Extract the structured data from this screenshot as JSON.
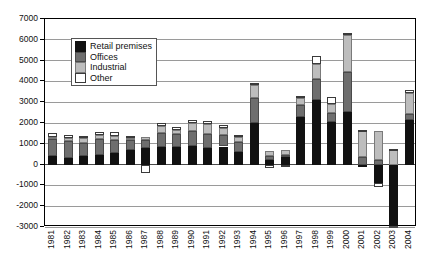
{
  "chart_data": {
    "type": "bar",
    "stacked": true,
    "title": "",
    "subtitle": "",
    "xlabel": "",
    "ylabel": "",
    "ylim": [
      -3000,
      7000
    ],
    "ytick_step": 1000,
    "yticks": [
      7000,
      6000,
      5000,
      4000,
      3000,
      2000,
      1000,
      0,
      -1000,
      -2000,
      -3000
    ],
    "ytick_labels": [
      "7000",
      "6000",
      "5000",
      "4000",
      "3000",
      "2000",
      "1000",
      "0",
      "-1000",
      "-2000",
      "-3000"
    ],
    "grid": true,
    "legend_position": "upper-left-inside",
    "categories": [
      "1981",
      "1982",
      "1983",
      "1984",
      "1985",
      "1986",
      "1987",
      "1988",
      "1989",
      "1990",
      "1991",
      "1992",
      "1993",
      "1994",
      "1995",
      "1996",
      "1997",
      "1998",
      "1999",
      "2000",
      "2001",
      "2002",
      "2003",
      "2004"
    ],
    "series": [
      {
        "name": "Retail premises",
        "color": "#111111",
        "values": [
          400,
          330,
          420,
          460,
          540,
          700,
          790,
          850,
          860,
          900,
          800,
          870,
          600,
          2000,
          200,
          380,
          2300,
          3100,
          2050,
          2550,
          -100,
          -900,
          -2950,
          2150
        ]
      },
      {
        "name": "Offices",
        "color": "#6e6e6e",
        "values": [
          820,
          790,
          640,
          790,
          660,
          480,
          390,
          660,
          630,
          700,
          660,
          560,
          480,
          1200,
          230,
          80,
          560,
          1000,
          440,
          1900,
          350,
          230,
          -80,
          280
        ]
      },
      {
        "name": "Industrial",
        "color": "#bdbdbd",
        "values": [
          120,
          160,
          200,
          190,
          190,
          120,
          140,
          330,
          180,
          420,
          500,
          340,
          260,
          620,
          200,
          260,
          340,
          750,
          430,
          1800,
          1250,
          1400,
          680,
          1000
        ]
      },
      {
        "name": "Other",
        "color": "#ffffff",
        "values": [
          160,
          130,
          100,
          130,
          170,
          80,
          -420,
          140,
          160,
          130,
          140,
          120,
          100,
          80,
          -160,
          -130,
          120,
          390,
          320,
          100,
          60,
          -170,
          90,
          140
        ]
      }
    ]
  },
  "legend": {
    "entries": [
      {
        "label": "Retail premises",
        "key": "retail"
      },
      {
        "label": "Offices",
        "key": "offices"
      },
      {
        "label": "Industrial",
        "key": "industrial"
      },
      {
        "label": "Other",
        "key": "other"
      }
    ]
  }
}
